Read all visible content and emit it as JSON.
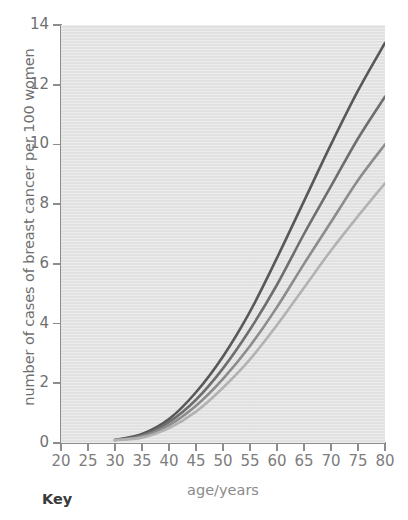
{
  "chart_data": {
    "type": "line",
    "title": "",
    "xlabel": "age/years",
    "ylabel": "number of cases of breast cancer per 100 women",
    "xlim": [
      20,
      80
    ],
    "ylim": [
      0,
      14
    ],
    "xticks": [
      20,
      25,
      30,
      35,
      40,
      45,
      50,
      55,
      60,
      65,
      70,
      75,
      80
    ],
    "yticks": [
      0,
      2,
      4,
      6,
      8,
      10,
      12,
      14
    ],
    "grid": false,
    "legend_position": "below-plot-cropped",
    "plot_background": "#e4e4e4",
    "x": [
      30,
      35,
      40,
      45,
      50,
      55,
      60,
      65,
      70,
      75,
      80
    ],
    "series": [
      {
        "name": "curve-1",
        "color": "#585858",
        "values": [
          0.1,
          0.3,
          0.8,
          1.7,
          2.9,
          4.4,
          6.2,
          8.1,
          10.0,
          11.8,
          13.4
        ]
      },
      {
        "name": "curve-2",
        "color": "#6e6e6e",
        "values": [
          0.1,
          0.25,
          0.7,
          1.45,
          2.5,
          3.8,
          5.3,
          7.0,
          8.6,
          10.2,
          11.6
        ]
      },
      {
        "name": "curve-3",
        "color": "#8c8c8c",
        "values": [
          0.1,
          0.22,
          0.6,
          1.25,
          2.15,
          3.25,
          4.55,
          6.0,
          7.4,
          8.8,
          10.0
        ]
      },
      {
        "name": "curve-4",
        "color": "#b2b2b2",
        "values": [
          0.1,
          0.18,
          0.5,
          1.05,
          1.85,
          2.8,
          3.95,
          5.2,
          6.45,
          7.6,
          8.7
        ]
      }
    ]
  },
  "key": {
    "heading": "Key"
  }
}
